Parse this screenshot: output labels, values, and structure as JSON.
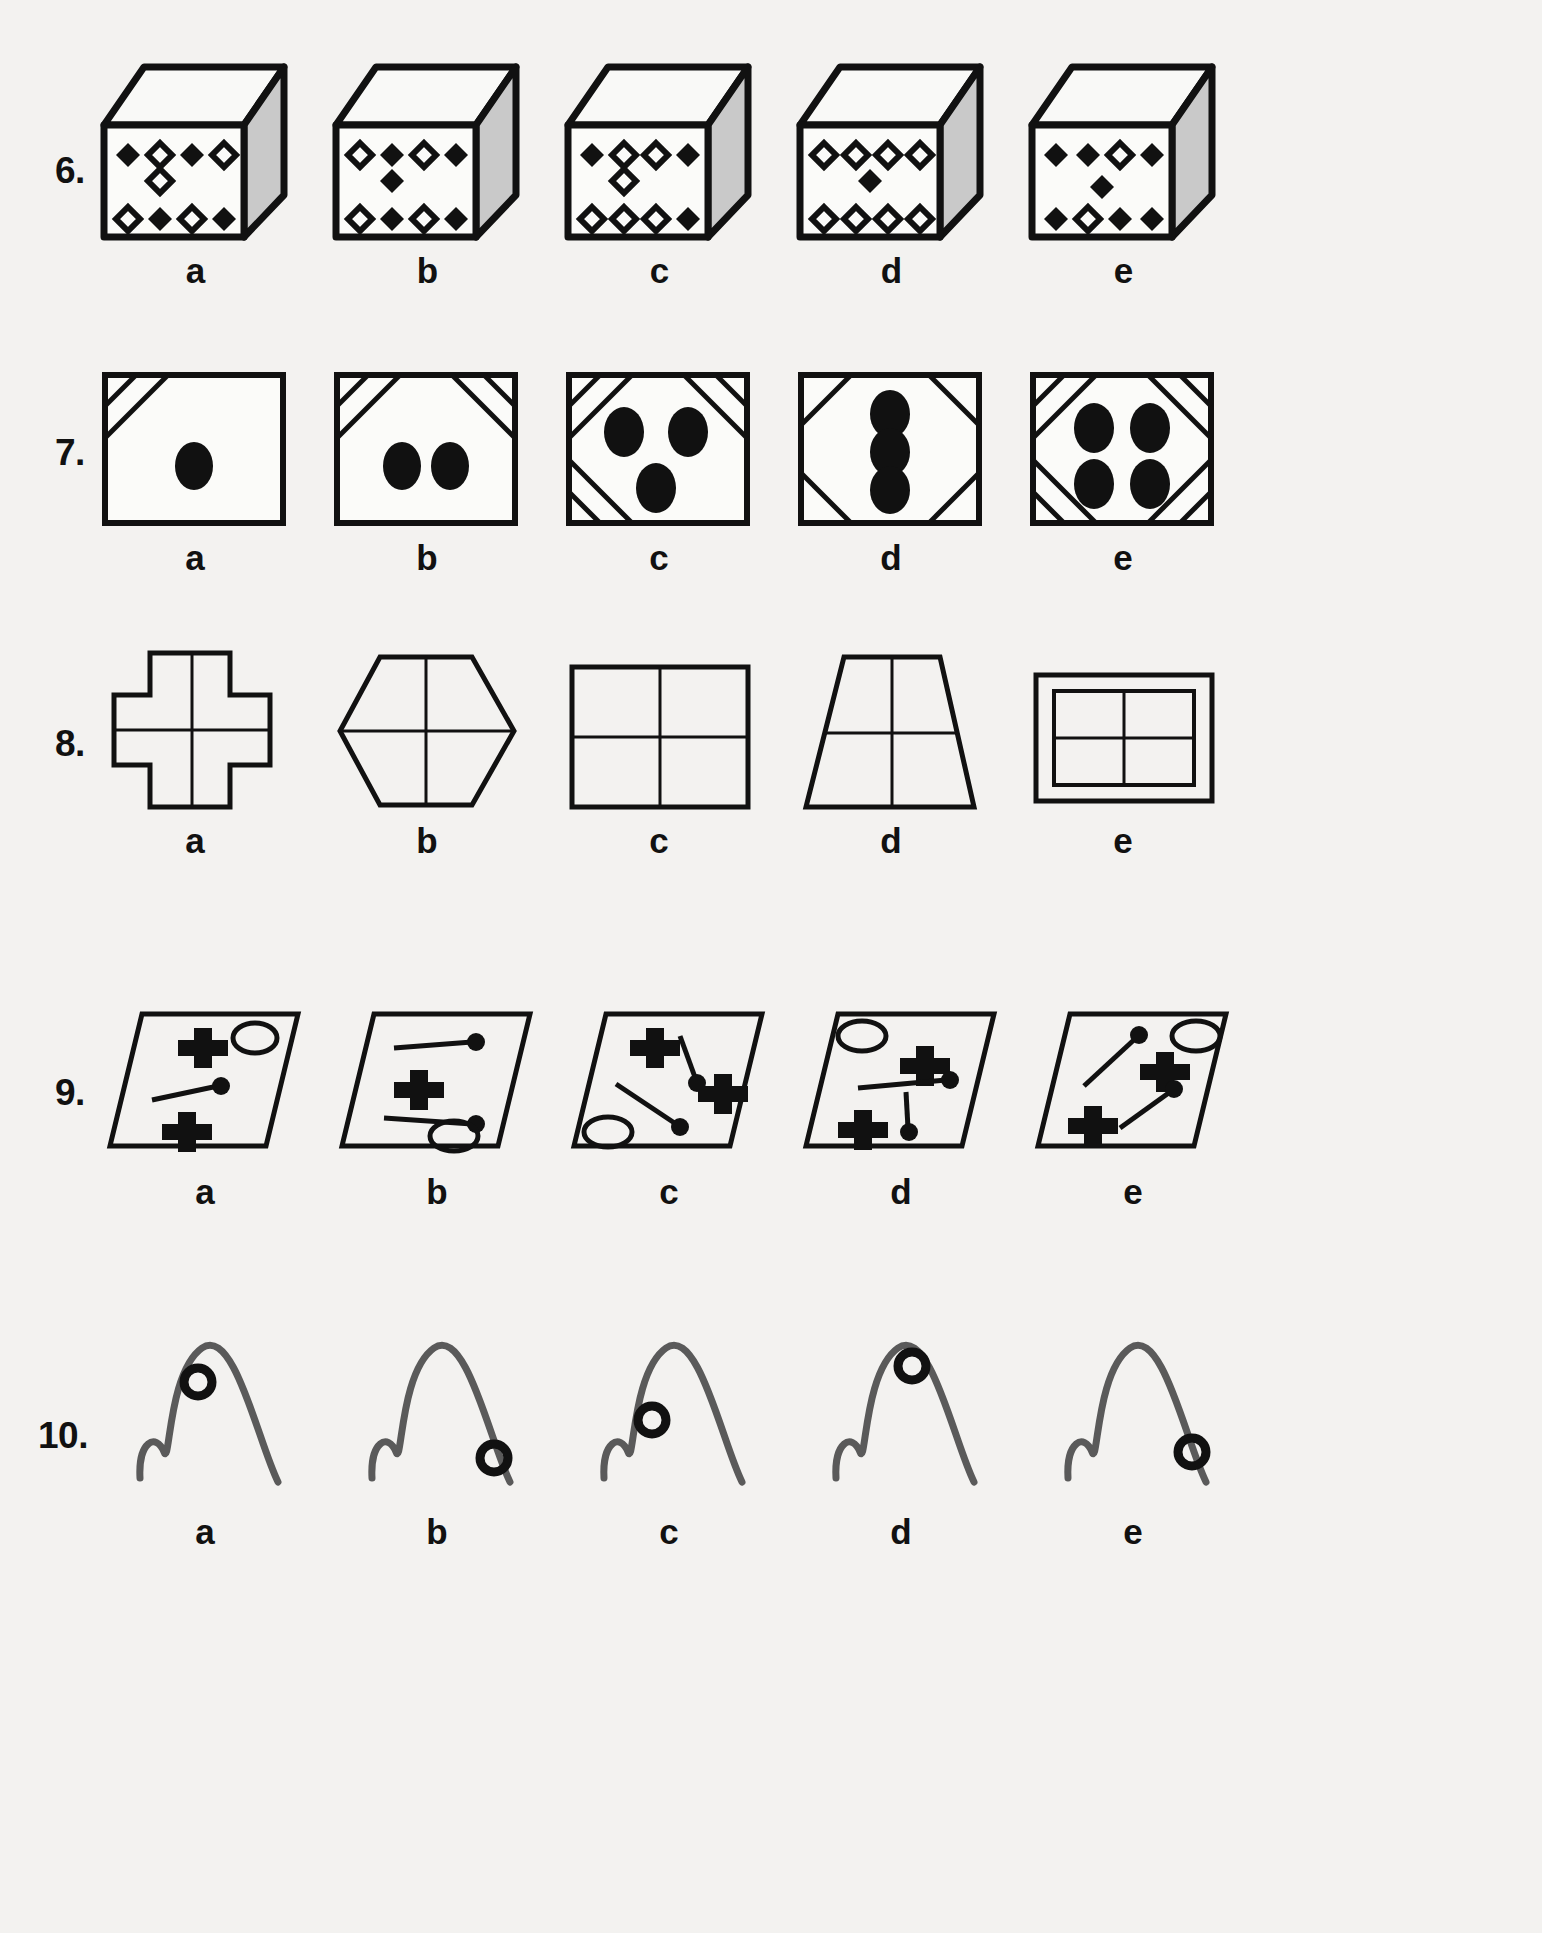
{
  "page": {
    "background": "#f3f2f0",
    "ink": "#111111",
    "shade": "#c9c9c9",
    "stroke_gray": "#5a5a5a"
  },
  "option_letters": [
    "a",
    "b",
    "c",
    "d",
    "e"
  ],
  "questions": [
    {
      "number": "6.",
      "type": "cube-dice",
      "y": 55,
      "options": [
        {
          "letter": "a",
          "top_row": [
            "filled",
            "open",
            "filled",
            "open"
          ],
          "middle": [
            "open"
          ],
          "bottom_row": [
            "open",
            "filled",
            "open",
            "filled"
          ]
        },
        {
          "letter": "b",
          "top_row": [
            "open",
            "filled",
            "open",
            "filled"
          ],
          "middle": [
            "filled"
          ],
          "bottom_row": [
            "open",
            "filled",
            "open",
            "filled"
          ]
        },
        {
          "letter": "c",
          "top_row": [
            "filled",
            "open",
            "open",
            "filled"
          ],
          "middle": [
            "open"
          ],
          "bottom_row": [
            "open",
            "open",
            "open",
            "filled"
          ]
        },
        {
          "letter": "d",
          "top_row": [
            "open",
            "open",
            "open",
            "open"
          ],
          "middle": [
            "filled"
          ],
          "bottom_row": [
            "open",
            "open",
            "open",
            "open"
          ]
        },
        {
          "letter": "e",
          "top_row": [
            "filled",
            "filled",
            "open",
            "filled"
          ],
          "middle": [
            "filled"
          ],
          "bottom_row": [
            "filled",
            "open",
            "filled",
            "filled"
          ]
        }
      ]
    },
    {
      "number": "7.",
      "type": "square-corners-dots",
      "y": 360,
      "options": [
        {
          "letter": "a",
          "corners": [
            "tl"
          ],
          "dots": 1,
          "dot_layout": "center"
        },
        {
          "letter": "b",
          "corners": [
            "tl",
            "tr"
          ],
          "dots": 2,
          "dot_layout": "pair-horizontal"
        },
        {
          "letter": "c",
          "corners": [
            "tl",
            "tr",
            "bl"
          ],
          "dots": 3,
          "dot_layout": "triangle"
        },
        {
          "letter": "d",
          "corners": [
            "tl",
            "tr",
            "bl",
            "br"
          ],
          "dots": 3,
          "dot_layout": "column"
        },
        {
          "letter": "e",
          "corners": [
            "tl",
            "tr",
            "bl",
            "br"
          ],
          "dots": 4,
          "dot_layout": "quad"
        }
      ]
    },
    {
      "number": "8.",
      "type": "outline-crosshair",
      "y": 640,
      "options": [
        {
          "letter": "a",
          "shape": "plus-cross"
        },
        {
          "letter": "b",
          "shape": "hexagon"
        },
        {
          "letter": "c",
          "shape": "rectangle"
        },
        {
          "letter": "d",
          "shape": "trapezoid"
        },
        {
          "letter": "e",
          "shape": "double-rectangle"
        }
      ]
    },
    {
      "number": "9.",
      "type": "parallelogram-symbols",
      "y": 1000,
      "options": [
        {
          "letter": "a",
          "crosses": [
            [
              0.3,
              0.22
            ],
            [
              0.45,
              0.8
            ]
          ],
          "ovals": [
            [
              0.7,
              0.2
            ]
          ],
          "pins": [
            [
              0.22,
              0.58,
              0.58,
              0.46
            ]
          ]
        },
        {
          "letter": "b",
          "crosses": [
            [
              0.33,
              0.52
            ]
          ],
          "ovals": [
            [
              0.62,
              0.86
            ]
          ],
          "pins": [
            [
              0.32,
              0.2,
              0.7,
              0.24
            ],
            [
              0.36,
              0.78,
              0.74,
              0.8
            ]
          ]
        },
        {
          "letter": "c",
          "crosses": [
            [
              0.3,
              0.2
            ],
            [
              0.72,
              0.52
            ]
          ],
          "ovals": [
            [
              0.18,
              0.86
            ]
          ],
          "pins": [
            [
              0.46,
              0.18,
              0.53,
              0.5
            ],
            [
              0.26,
              0.52,
              0.58,
              0.82
            ]
          ]
        },
        {
          "letter": "d",
          "crosses": [
            [
              0.5,
              0.38
            ],
            [
              0.26,
              0.84
            ]
          ],
          "ovals": [
            [
              0.25,
              0.16
            ]
          ],
          "pins": [
            [
              0.3,
              0.58,
              0.68,
              0.52
            ],
            [
              0.54,
              0.62,
              0.52,
              0.88
            ]
          ]
        },
        {
          "letter": "e",
          "crosses": [
            [
              0.24,
              0.82
            ],
            [
              0.58,
              0.42
            ]
          ],
          "ovals": [
            [
              0.8,
              0.18
            ]
          ],
          "pins": [
            [
              0.28,
              0.5,
              0.52,
              0.18
            ],
            [
              0.44,
              0.84,
              0.72,
              0.5
            ]
          ]
        }
      ]
    },
    {
      "number": "10.",
      "type": "curve-ring",
      "y": 1330,
      "options": [
        {
          "letter": "a",
          "ring": [
            0.42,
            0.28
          ]
        },
        {
          "letter": "b",
          "ring": [
            0.86,
            0.82
          ]
        },
        {
          "letter": "c",
          "ring": [
            0.4,
            0.52
          ]
        },
        {
          "letter": "d",
          "ring": [
            0.62,
            0.2
          ]
        },
        {
          "letter": "e",
          "ring": [
            0.86,
            0.78
          ]
        }
      ]
    }
  ]
}
